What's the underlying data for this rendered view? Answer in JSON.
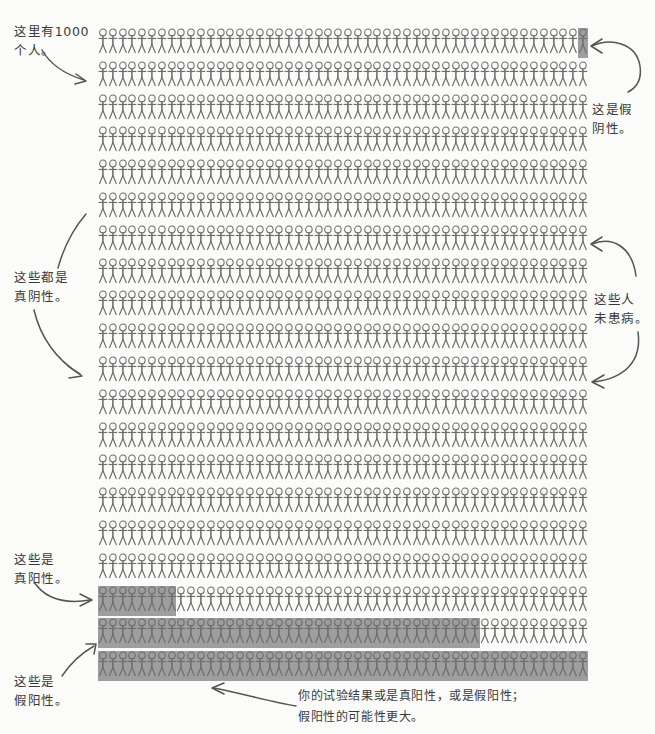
{
  "figure": {
    "title_note": "这里有1000\n个人。",
    "total_people": 1000,
    "grid": {
      "rows": 20,
      "columns": 50,
      "icon": "stick-figure-icon",
      "row_spacing_px": 32.8,
      "column_spacing_px": 9.8
    },
    "colors": {
      "paper": "#fbfbf9",
      "ink": "#3a3a3a",
      "figure_ink": "#6e6e6e",
      "highlight": "#9e9e9e"
    }
  },
  "annotations": [
    {
      "id": "total-count",
      "text": "这里有1000\n个人。",
      "position": "top-left",
      "points_to": "grid-row-1-start"
    },
    {
      "id": "false-negative",
      "text": "这是假\n阴性。",
      "position": "top-right",
      "points_to": "grid-row-1-last-cell"
    },
    {
      "id": "true-negative",
      "text": "这些都是\n真阴性。",
      "position": "middle-left",
      "points_to": "grid-unhighlighted-block"
    },
    {
      "id": "no-disease",
      "text": "这些人\n未患病。",
      "position": "middle-right",
      "points_to": "grid-unhighlighted-block"
    },
    {
      "id": "true-positive",
      "text": "这些是\n真阳性。",
      "position": "lower-left",
      "points_to": "grid-row-18-highlight"
    },
    {
      "id": "false-positive",
      "text": "这些是\n假阳性。",
      "position": "bottom-left",
      "points_to": "grid-row-20-highlight"
    },
    {
      "id": "caption",
      "text": "你的试验结果或是真阳性，或是假阳性；\n假阳性的可能性更大。",
      "position": "bottom-center",
      "points_to": "grid-bottom-highlight-rows"
    }
  ],
  "chart_data": {
    "type": "pictogram",
    "unit_value": 1,
    "total_units": 1000,
    "rows": 20,
    "columns": 50,
    "categories": [
      "真阴性",
      "假阴性",
      "真阳性",
      "假阳性"
    ],
    "legend": [
      {
        "label": "未高亮（未患病 / 阴性结果）",
        "color": "#ffffff"
      },
      {
        "label": "高亮（阳性结果）",
        "color": "#9e9e9e"
      }
    ],
    "highlight_segments": [
      {
        "row": 1,
        "start_col": 50,
        "end_col": 50,
        "category": "假阴性",
        "count": 1
      },
      {
        "row": 18,
        "start_col": 1,
        "end_col": 8,
        "category": "真阳性",
        "count": 8
      },
      {
        "row": 19,
        "start_col": 1,
        "end_col": 39,
        "category": "假阳性",
        "count": 39
      },
      {
        "row": 20,
        "start_col": 1,
        "end_col": 50,
        "category": "假阳性",
        "count": 50
      }
    ],
    "values": {
      "真阳性": 8,
      "假阴性": 1,
      "假阳性": 89,
      "真阴性": 902
    }
  }
}
